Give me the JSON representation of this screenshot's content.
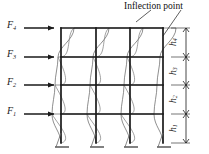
{
  "figure": {
    "background_color": "#ffffff",
    "line_color": "#1a1a1a",
    "deflected_color": "#555555",
    "annotation": {
      "label": "Inflection point",
      "name": "inflection-point-annotation"
    },
    "forces": [
      {
        "id": "F4",
        "base": "F",
        "sub": "4",
        "x": 8,
        "y": 19,
        "arrow_y": 28,
        "arrow_x1": 24,
        "arrow_x2": 56
      },
      {
        "id": "F3",
        "base": "F",
        "sub": "3",
        "x": 8,
        "y": 48,
        "arrow_y": 57,
        "arrow_x1": 24,
        "arrow_x2": 56
      },
      {
        "id": "F2",
        "base": "F",
        "sub": "2",
        "x": 8,
        "y": 76,
        "arrow_y": 85,
        "arrow_x1": 24,
        "arrow_x2": 56
      },
      {
        "id": "F1",
        "base": "F",
        "sub": "1",
        "x": 8,
        "y": 105,
        "arrow_y": 114,
        "arrow_x1": 24,
        "arrow_x2": 56
      }
    ],
    "heights": [
      {
        "id": "h4",
        "base": "h",
        "sub": "4",
        "y_top": 28,
        "y_bottom": 57,
        "label_x": 176,
        "label_y": 42
      },
      {
        "id": "h3",
        "base": "h",
        "sub": "3",
        "y_top": 57,
        "y_bottom": 85,
        "label_x": 176,
        "label_y": 71
      },
      {
        "id": "h2",
        "base": "h",
        "sub": "2",
        "y_top": 85,
        "y_bottom": 114,
        "label_x": 176,
        "label_y": 99
      },
      {
        "id": "h1",
        "base": "h",
        "sub": "1",
        "y_top": 114,
        "y_bottom": 143,
        "label_x": 176,
        "label_y": 128
      }
    ],
    "frame": {
      "columns_x": [
        61,
        96,
        130,
        163
      ],
      "beam_levels_y": [
        28,
        57,
        85,
        114
      ],
      "base_y": 143,
      "storeys": 4,
      "bays": 3
    },
    "dimension_line": {
      "x": 186,
      "y_top": 28,
      "y_bottom": 143,
      "name": "height-dimension-line"
    }
  }
}
